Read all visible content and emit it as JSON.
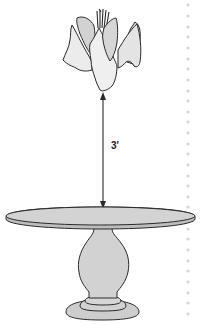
{
  "diagram": {
    "measurement": {
      "label": "3'",
      "orientation": "vertical",
      "arrow": "double-headed"
    },
    "elements": [
      {
        "name": "centerpiece",
        "description": "folded napkin / floral arrangement with stems on top"
      },
      {
        "name": "dimension-arrow",
        "description": "double-headed arrow from bottom of centerpiece to tabletop"
      },
      {
        "name": "round-pedestal-table",
        "description": "oval tabletop on baluster pedestal with stepped round base"
      }
    ],
    "colors": {
      "fill_light": "#ececec",
      "fill_mid": "#d4d4d4",
      "fill_table": "#cfcfcf",
      "stroke": "#2a2a2a",
      "dotted_guide": "#d8d8d8",
      "background": "#ffffff"
    }
  }
}
